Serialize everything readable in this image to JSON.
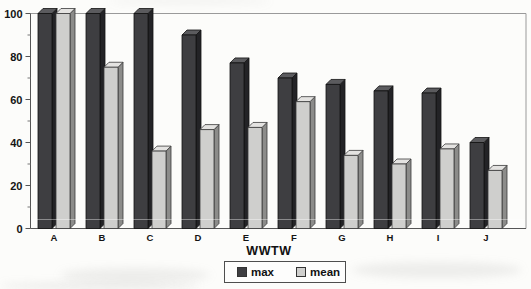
{
  "chart_data": {
    "type": "bar",
    "title": "",
    "xlabel": "WWTW",
    "ylabel": "",
    "categories": [
      "A",
      "B",
      "C",
      "D",
      "E",
      "F",
      "G",
      "H",
      "I",
      "J"
    ],
    "series": [
      {
        "name": "max",
        "values": [
          100,
          100,
          100,
          90,
          77,
          70,
          67,
          64,
          63,
          40
        ],
        "color": {
          "front": "#3e3e41",
          "side": "#232326",
          "top": "#5b5b5e"
        }
      },
      {
        "name": "mean",
        "values": [
          100,
          75,
          36,
          46,
          47,
          59,
          34,
          30,
          37,
          27
        ],
        "color": {
          "front": "#cfcfcd",
          "side": "#8c8c8a",
          "top": "#e4e3e1"
        }
      }
    ],
    "ylim": [
      0,
      100
    ],
    "y_major_ticks": [
      0,
      20,
      40,
      60,
      80,
      100
    ],
    "y_minor_step": 10,
    "grid": false,
    "effect_3d": true,
    "legend_position": "bottom-center",
    "axis_color": "#555555",
    "frame_color": "#9a9a9a"
  }
}
